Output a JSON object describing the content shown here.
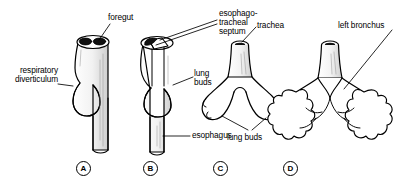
{
  "figure": {
    "type": "anatomical-line-diagram",
    "background_color": "#ffffff",
    "ink_color": "#000000",
    "shading_color": "#8a8a8a"
  },
  "labels": {
    "foregut": "foregut",
    "respiratory_diverticulum_line1": "respiratory",
    "respiratory_diverticulum_line2": "diverticulum",
    "septum_line1": "esophago-",
    "septum_line2": "tracheal",
    "septum_line3": "septum",
    "lung_buds_b_line1": "lung",
    "lung_buds_b_line2": "buds",
    "esophagus": "esophagus",
    "trachea": "trachea",
    "lung_buds_c": "lung buds",
    "left_bronchus": "left bronchus"
  },
  "panels": [
    {
      "letter": "A",
      "stage": "respiratory diverticulum forming on foregut"
    },
    {
      "letter": "B",
      "stage": "esophagotracheal septum separating trachea from esophagus"
    },
    {
      "letter": "C",
      "stage": "trachea with paired lung buds"
    },
    {
      "letter": "D",
      "stage": "branching bronchial tree with left bronchus"
    }
  ]
}
